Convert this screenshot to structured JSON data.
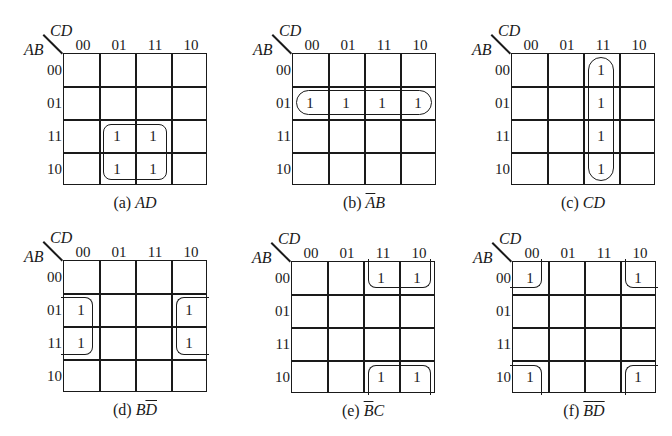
{
  "axis": {
    "col_var": "CD",
    "row_var": "AB",
    "col_labels": [
      "00",
      "01",
      "11",
      "10"
    ],
    "row_labels": [
      "00",
      "01",
      "11",
      "10"
    ]
  },
  "maps": [
    {
      "id": "a",
      "caption_prefix": "(a) ",
      "caption_term": [
        {
          "t": "A",
          "bar": false
        },
        {
          "t": "D",
          "bar": false
        }
      ],
      "ones": [
        [
          2,
          1
        ],
        [
          2,
          2
        ],
        [
          3,
          1
        ],
        [
          3,
          2
        ]
      ],
      "cell_value": "1"
    },
    {
      "id": "b",
      "caption_prefix": "(b) ",
      "caption_term": [
        {
          "t": "A",
          "bar": true
        },
        {
          "t": "B",
          "bar": false
        }
      ],
      "ones": [
        [
          1,
          0
        ],
        [
          1,
          1
        ],
        [
          1,
          2
        ],
        [
          1,
          3
        ]
      ],
      "cell_value": "1"
    },
    {
      "id": "c",
      "caption_prefix": "(c) ",
      "caption_term": [
        {
          "t": "C",
          "bar": false
        },
        {
          "t": "D",
          "bar": false
        }
      ],
      "ones": [
        [
          0,
          2
        ],
        [
          1,
          2
        ],
        [
          2,
          2
        ],
        [
          3,
          2
        ]
      ],
      "cell_value": "1"
    },
    {
      "id": "d",
      "caption_prefix": "(d) ",
      "caption_term": [
        {
          "t": "B",
          "bar": false
        },
        {
          "t": "D",
          "bar": true
        }
      ],
      "ones": [
        [
          1,
          0
        ],
        [
          2,
          0
        ],
        [
          1,
          3
        ],
        [
          2,
          3
        ]
      ],
      "cell_value": "1"
    },
    {
      "id": "e",
      "caption_prefix": "(e) ",
      "caption_term": [
        {
          "t": "B",
          "bar": true
        },
        {
          "t": "C",
          "bar": false
        }
      ],
      "ones": [
        [
          0,
          2
        ],
        [
          0,
          3
        ],
        [
          3,
          2
        ],
        [
          3,
          3
        ]
      ],
      "cell_value": "1"
    },
    {
      "id": "f",
      "caption_prefix": "(f) ",
      "caption_term": [
        {
          "t": "B",
          "bar": true
        },
        {
          "t": "D",
          "bar": true
        }
      ],
      "ones": [
        [
          0,
          0
        ],
        [
          0,
          3
        ],
        [
          3,
          0
        ],
        [
          3,
          3
        ]
      ],
      "cell_value": "1"
    }
  ]
}
